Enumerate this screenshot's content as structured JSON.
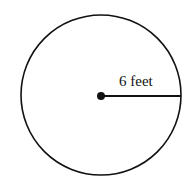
{
  "diagram": {
    "type": "circle-with-radius",
    "radius_label": "6 feet",
    "colors": {
      "stroke": "#111111",
      "background": "#ffffff"
    }
  }
}
